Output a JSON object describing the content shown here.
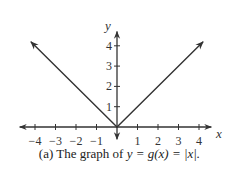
{
  "chart_data": {
    "type": "line",
    "title": "",
    "caption": "(a) The graph of y = g(x) = |x|.",
    "xlabel": "x",
    "ylabel": "y",
    "x_ticks": [
      -4,
      -3,
      -2,
      -1,
      1,
      2,
      3,
      4
    ],
    "y_ticks": [
      1,
      2,
      3,
      4
    ],
    "xlim": [
      -4.6,
      4.6
    ],
    "ylim": [
      -0.5,
      4.6
    ],
    "grid": false,
    "legend": null,
    "series": [
      {
        "name": "y = |x|",
        "x": [
          -4.2,
          0,
          4.2
        ],
        "y": [
          4.2,
          0,
          4.2
        ],
        "arrows": "both-ends"
      }
    ]
  },
  "caption": {
    "prefix": "(a) The graph of ",
    "formula": "y = g(x) = |x|."
  },
  "axis_labels": {
    "x": "x",
    "y": "y"
  }
}
